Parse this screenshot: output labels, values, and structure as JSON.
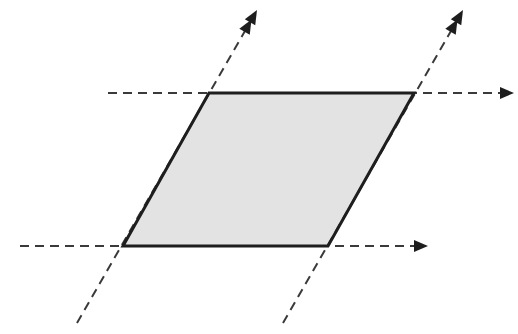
{
  "diagram": {
    "type": "parallelogram-with-extended-sides",
    "colors": {
      "background": "#ffffff",
      "fill": "#e3e3e3",
      "edge": "#1e1e1e",
      "dashed": "#3a3a3a",
      "arrow": "#1e1e1e"
    },
    "parallelogram": {
      "vertices": [
        [
          209,
          93
        ],
        [
          414,
          93
        ],
        [
          328,
          246
        ],
        [
          123,
          246
        ]
      ]
    },
    "lines": [
      {
        "name": "top-horizontal",
        "from": [
          108,
          93
        ],
        "to": [
          514,
          93
        ],
        "arrow": "single"
      },
      {
        "name": "bottom-horizontal",
        "from": [
          20,
          246
        ],
        "to": [
          428,
          246
        ],
        "arrow": "single"
      },
      {
        "name": "left-slanted",
        "from": [
          77,
          323
        ],
        "to": [
          257,
          10
        ],
        "arrow": "double"
      },
      {
        "name": "right-slanted",
        "from": [
          283,
          323
        ],
        "to": [
          463,
          10
        ],
        "arrow": "double"
      }
    ]
  }
}
